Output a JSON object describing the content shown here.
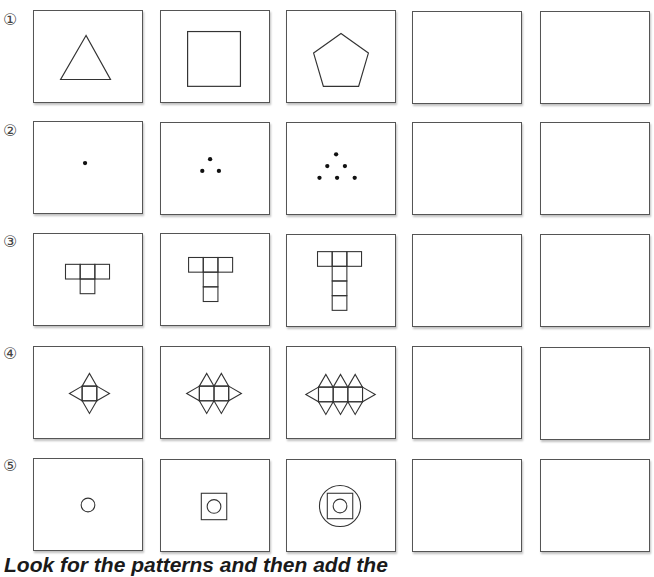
{
  "header": {
    "partial_text": "(cut-off heading)"
  },
  "rows": [
    {
      "label": "①",
      "pattern": "polygons",
      "items": [
        "triangle",
        "square",
        "pentagon",
        "",
        ""
      ]
    },
    {
      "label": "②",
      "pattern": "triangular-dots",
      "items": [
        "1 dot",
        "3 dots",
        "6 dots",
        "",
        ""
      ]
    },
    {
      "label": "③",
      "pattern": "growing-T",
      "items": [
        "T with 1 stem square",
        "T with 2 stem squares",
        "T with 3 stem squares",
        "",
        ""
      ]
    },
    {
      "label": "④",
      "pattern": "squares-with-triangles",
      "items": [
        "1 square",
        "2 squares",
        "3 squares",
        "",
        ""
      ]
    },
    {
      "label": "⑤",
      "pattern": "nested-shapes",
      "items": [
        "circle",
        "circle in square",
        "circle in square in circle",
        "",
        ""
      ]
    }
  ],
  "footer": {
    "instruction": "Look for the patterns and then add the"
  }
}
